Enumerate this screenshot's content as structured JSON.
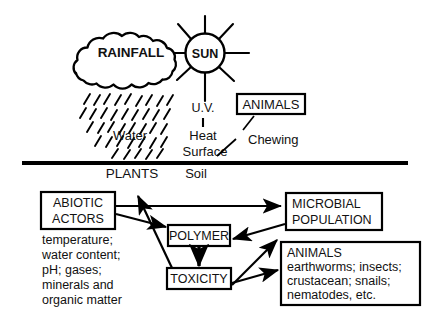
{
  "diagram": {
    "title_present": false,
    "upper_zone": {
      "name": "above-ground-environment",
      "cloud_label": "RAINFALL",
      "sun_label": "SUN",
      "sun_rays": 8,
      "labels": {
        "uv": "U.V.",
        "heat": "Heat",
        "surface": "Surface",
        "water": "Water",
        "chewing": "Chewing"
      },
      "animals_box_label": "ANIMALS"
    },
    "divider": {
      "name": "ground-surface-line",
      "left_label": "PLANTS",
      "right_label": "Soil"
    },
    "lower_zone": {
      "name": "soil-subsystem",
      "abiotic": {
        "box_line1": "ABIOTIC",
        "box_line2": "ACTORS",
        "list": [
          "temperature;",
          "water content;",
          "pH; gases;",
          "minerals and",
          "organic matter"
        ]
      },
      "polymer_label": "POLYMER",
      "toxicity_label": "TOXICITY",
      "microbial": {
        "line1": "MICROBIAL",
        "line2": "POPULATION"
      },
      "animals": {
        "heading": "ANIMALS",
        "list": [
          "earthworms; insects;",
          "crustacean; snails;",
          "nematodes, etc."
        ]
      }
    },
    "colors": {
      "ink": "#111111",
      "stroke": "#000000",
      "background": "#ffffff"
    }
  }
}
